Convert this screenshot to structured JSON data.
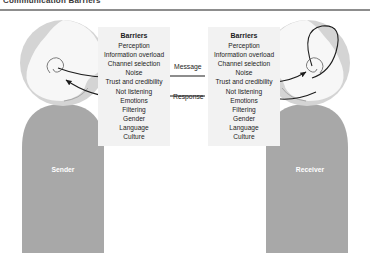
{
  "figure": {
    "caption": "Communication Barriers",
    "accent_color": "#8d8d8d",
    "body_color": "#a8a8a8",
    "head_color": "#d4d4d4",
    "face_color": "#f7f7f7",
    "panel_color": "#f2f2f2",
    "line_color": "#1d1d1d"
  },
  "diagram": {
    "type": "process-flow",
    "barriers_title": "Barriers",
    "barriers": [
      "Perception",
      "Information overload",
      "Channel selection",
      "Noise",
      "Trust and credibility",
      "Not listening",
      "Emotions",
      "Filtering",
      "Gender",
      "Language",
      "Culture"
    ],
    "left_panel": {
      "title": "Barriers",
      "items": [
        "Perception",
        "Information overload",
        "Channel selection",
        "Noise",
        "Trust and credibility",
        "Not listening",
        "Emotions",
        "Filtering",
        "Gender",
        "Language",
        "Culture"
      ]
    },
    "right_panel": {
      "title": "Barriers",
      "items": [
        "Perception",
        "Information overload",
        "Channel selection",
        "Noise",
        "Trust and credibility",
        "Not listening",
        "Emotions",
        "Filtering",
        "Gender",
        "Language",
        "Culture"
      ]
    },
    "flows": [
      {
        "label": "Message",
        "direction": "left-to-right"
      },
      {
        "label": "Response",
        "direction": "right-to-left"
      }
    ],
    "actors": [
      {
        "label": "Sender",
        "side": "left"
      },
      {
        "label": "Receiver",
        "side": "right"
      }
    ]
  }
}
